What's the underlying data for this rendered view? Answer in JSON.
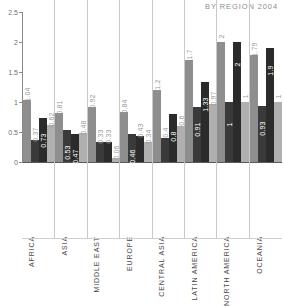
{
  "chart_data": {
    "type": "bar",
    "title": "BY REGION 2004",
    "xlabel": "",
    "ylabel": "",
    "ylim": [
      0,
      2.5
    ],
    "yticks": [
      "0",
      "0.5",
      "1",
      "1.5",
      "2",
      "2.5"
    ],
    "ytick_values": [
      0,
      0.5,
      1,
      1.5,
      2,
      2.5
    ],
    "grid": false,
    "legend_position": "none",
    "categories": [
      "AFRICA",
      "ASIA",
      "MIDDLE EAST",
      "EUROPE",
      "CENTRAL ASIA",
      "LATIN AMERICA",
      "NORTH AMERICA",
      "OCEANIA"
    ],
    "series": [
      {
        "name": "series-1",
        "color": "#8e8e8e",
        "values": [
          1.04,
          0.81,
          0.92,
          0.84,
          1.2,
          1.7,
          2,
          1.79
        ],
        "labels": [
          "1.04",
          "0.81",
          "0.92",
          "0.84",
          "1.2",
          "1.7",
          "2",
          "1.79"
        ]
      },
      {
        "name": "series-2",
        "color": "#3a3a3a",
        "values": [
          0.37,
          0.53,
          0.33,
          0.46,
          0.4,
          0.91,
          1,
          0.93
        ],
        "labels": [
          "0.37",
          "0.53",
          "0.33",
          "0.46",
          "0.4",
          "0.91",
          "1",
          "0.93"
        ]
      },
      {
        "name": "series-3",
        "color": "#2b2b2b",
        "values": [
          0.73,
          0.47,
          0.33,
          0.43,
          0.8,
          1.33,
          2,
          1.9
        ],
        "labels": [
          "0.73",
          "0.47",
          "0.33",
          "0.43",
          "0.8",
          "1.33",
          "2",
          "1.9"
        ]
      },
      {
        "name": "series-4",
        "color": "#b0b0b0",
        "values": [
          0.62,
          0.48,
          0.06,
          0.34,
          0.6,
          0.97,
          1,
          1
        ],
        "labels": [
          "0.62",
          "0.48",
          "0.06",
          "0.34",
          "0.6",
          "0.97",
          "1",
          "1"
        ]
      }
    ]
  }
}
